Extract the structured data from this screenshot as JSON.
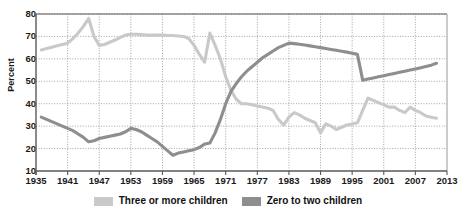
{
  "chart_data": {
    "type": "line",
    "title": "",
    "subtitle": "",
    "xlabel": "",
    "ylabel": "Percent",
    "xlim": [
      1935,
      2013
    ],
    "ylim": [
      10,
      80
    ],
    "grid": true,
    "legend_position": "bottom",
    "x_ticks": [
      1935,
      1941,
      1947,
      1953,
      1959,
      1965,
      1971,
      1977,
      1983,
      1989,
      1995,
      2001,
      2007,
      2013
    ],
    "y_ticks": [
      10,
      20,
      30,
      40,
      50,
      60,
      70,
      80
    ],
    "colors": {
      "three_or_more": "#c9c9c9",
      "zero_to_two": "#8e8e8e",
      "axis": "#595959",
      "grid": "#8c8c8c",
      "text": "#1a1a1a",
      "background": "#ffffff"
    },
    "series": [
      {
        "name": "Three or more children",
        "color": "#c9c9c9",
        "x": [
          1936,
          1937,
          1938,
          1939,
          1940,
          1941,
          1942,
          1943,
          1944,
          1945,
          1946,
          1947,
          1948,
          1949,
          1950,
          1951,
          1952,
          1953,
          1954,
          1955,
          1956,
          1957,
          1958,
          1959,
          1960,
          1961,
          1962,
          1963,
          1964,
          1965,
          1966,
          1967,
          1968,
          1969,
          1970,
          1971,
          1972,
          1973,
          1974,
          1975,
          1976,
          1977,
          1978,
          1979,
          1980,
          1981,
          1982,
          1983,
          1984,
          1985,
          1986,
          1987,
          1988,
          1989,
          1990,
          1991,
          1992,
          1993,
          1994,
          1995,
          1996,
          1997,
          1998,
          1999,
          2000,
          2001,
          2002,
          2003,
          2004,
          2005,
          2006,
          2007,
          2008,
          2009,
          2010,
          2011
        ],
        "values": [
          64,
          64.6,
          65.2,
          65.8,
          66.4,
          67,
          69,
          71.5,
          74.5,
          78,
          70,
          66,
          66.4,
          67.4,
          68.4,
          69.6,
          70.6,
          71,
          71,
          70.8,
          70.6,
          70.6,
          70.6,
          70.6,
          70.4,
          70.4,
          70.2,
          70,
          69,
          66,
          62,
          58.5,
          71.5,
          66,
          60,
          52,
          46,
          42,
          40,
          40,
          39.5,
          39,
          38.5,
          38,
          37,
          33,
          30.5,
          34,
          36,
          35,
          33.5,
          32.5,
          31.5,
          27,
          31,
          30,
          28.5,
          29.5,
          30.5,
          31,
          31.5,
          37,
          42.5,
          41.5,
          40.5,
          39.5,
          38.5,
          38.5,
          37,
          36,
          38.5,
          37,
          36,
          34.5,
          34,
          33.5
        ]
      },
      {
        "name": "Zero to two children",
        "color": "#8e8e8e",
        "x": [
          1936,
          1937,
          1938,
          1939,
          1940,
          1941,
          1942,
          1943,
          1944,
          1945,
          1946,
          1947,
          1948,
          1949,
          1950,
          1951,
          1952,
          1953,
          1954,
          1955,
          1956,
          1957,
          1958,
          1959,
          1960,
          1961,
          1962,
          1963,
          1964,
          1965,
          1966,
          1967,
          1968,
          1969,
          1970,
          1971,
          1972,
          1973,
          1974,
          1975,
          1976,
          1977,
          1978,
          1979,
          1980,
          1981,
          1982,
          1983,
          1984,
          1985,
          1986,
          1987,
          1988,
          1989,
          1990,
          1991,
          1992,
          1993,
          1994,
          1995,
          1996,
          1997,
          1998,
          1999,
          2000,
          2001,
          2002,
          2003,
          2004,
          2005,
          2006,
          2007,
          2008,
          2009,
          2010,
          2011
        ],
        "values": [
          34,
          33,
          32,
          31,
          30,
          29,
          28,
          26.5,
          25,
          23,
          23.5,
          24.5,
          25,
          25.5,
          26,
          26.5,
          27.5,
          29,
          28.5,
          27.5,
          26,
          24.5,
          23,
          21,
          19,
          17,
          18,
          18.5,
          19,
          19.5,
          20.5,
          22,
          22.5,
          27,
          33,
          40,
          45.5,
          49,
          52,
          54.5,
          56.5,
          58.5,
          60.5,
          62,
          63.5,
          65,
          66,
          67,
          66.8,
          66.5,
          66.2,
          65.8,
          65.4,
          65,
          64.6,
          64.2,
          63.8,
          63.4,
          63,
          62.5,
          62,
          50.5,
          51,
          51.5,
          52,
          52.5,
          53,
          53.5,
          54,
          54.5,
          55,
          55.5,
          56,
          56.6,
          57.2,
          58
        ]
      }
    ]
  },
  "legend": {
    "items": [
      {
        "label": "Three or more children",
        "color": "#c9c9c9"
      },
      {
        "label": "Zero to two children",
        "color": "#8e8e8e"
      }
    ]
  },
  "axes": {
    "y_title": "Percent",
    "y_tick_labels": [
      "80",
      "70",
      "60",
      "50",
      "40",
      "30",
      "20",
      "10"
    ],
    "x_tick_labels": [
      "1935",
      "1941",
      "1947",
      "1953",
      "1959",
      "1965",
      "1971",
      "1977",
      "1983",
      "1989",
      "1995",
      "2001",
      "2007",
      "2013"
    ]
  }
}
